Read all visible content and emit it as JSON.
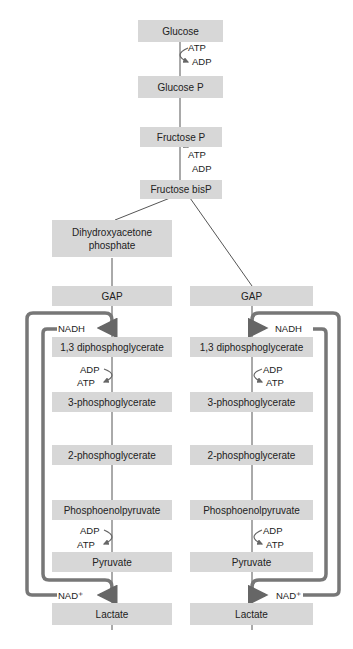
{
  "top": {
    "glucose": "Glucose",
    "glucose_p": "Glucose P",
    "fructose_p": "Fructose P",
    "fructose_bisp": "Fructose bisP",
    "dhap": "Dihydroxyacetone phosphate",
    "atp1": "ATP",
    "adp1": "ADP",
    "atp2": "ATP",
    "adp2": "ADP"
  },
  "left": {
    "gap": "GAP",
    "dpg": "1,3 diphosphoglycerate",
    "pg3": "3-phosphoglycerate",
    "pg2": "2-phosphoglycerate",
    "pep": "Phosphoenolpyruvate",
    "pyruvate": "Pyruvate",
    "lactate": "Lactate",
    "nadh": "NADH",
    "nad": "NAD⁺",
    "adp1": "ADP",
    "atp1": "ATP",
    "adp2": "ADP",
    "atp2": "ATP"
  },
  "right": {
    "gap": "GAP",
    "dpg": "1,3 diphosphoglycerate",
    "pg3": "3-phosphoglycerate",
    "pg2": "2-phosphoglycerate",
    "pep": "Phosphoenolpyruvate",
    "pyruvate": "Pyruvate",
    "lactate": "Lactate",
    "nadh": "NADH",
    "nad": "NAD⁺",
    "adp1": "ADP",
    "atp1": "ATP",
    "adp2": "ADP",
    "atp2": "ATP"
  },
  "colors": {
    "box": "#d7d7d7",
    "arrow": "#707070",
    "line": "#555555"
  }
}
